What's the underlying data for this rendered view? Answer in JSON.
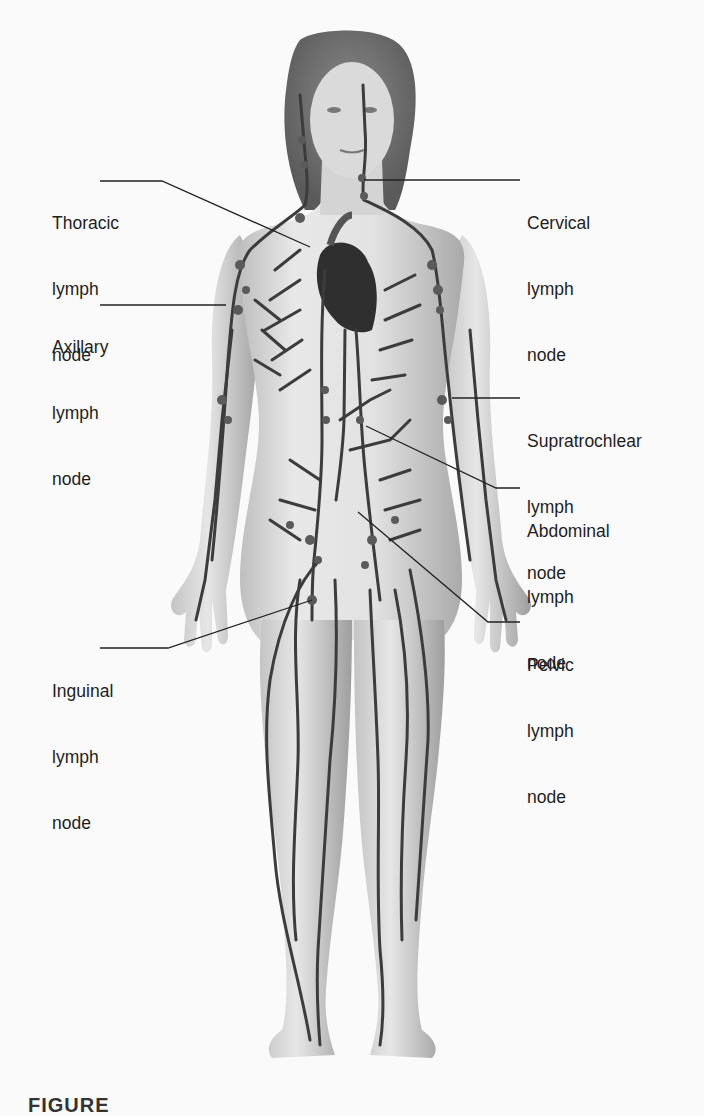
{
  "figure": {
    "caption_visible": "FIGURE",
    "colors": {
      "background": "#fafafa",
      "skin_light": "#e6e6e6",
      "skin_shade": "#b8b8b8",
      "hair": "#6e6e6e",
      "vessels": "#3c3c3c",
      "heart": "#2a2a2a",
      "leader_lines": "#222222",
      "text": "#1e1e1e"
    }
  },
  "labels": [
    {
      "id": "thoracic",
      "lines": [
        "Thoracic",
        "lymph",
        "node"
      ],
      "side": "left"
    },
    {
      "id": "axillary",
      "lines": [
        "Axillary",
        "lymph",
        "node"
      ],
      "side": "left"
    },
    {
      "id": "inguinal",
      "lines": [
        "Inguinal",
        "lymph",
        "node"
      ],
      "side": "left"
    },
    {
      "id": "cervical",
      "lines": [
        "Cervical",
        "lymph",
        "node"
      ],
      "side": "right"
    },
    {
      "id": "supratrochlear",
      "lines": [
        "Supratrochlear",
        "lymph",
        "node"
      ],
      "side": "right"
    },
    {
      "id": "abdominal",
      "lines": [
        "Abdominal",
        "lymph",
        "node"
      ],
      "side": "right"
    },
    {
      "id": "pelvic",
      "lines": [
        "Pelvic",
        "lymph",
        "node"
      ],
      "side": "right"
    }
  ]
}
